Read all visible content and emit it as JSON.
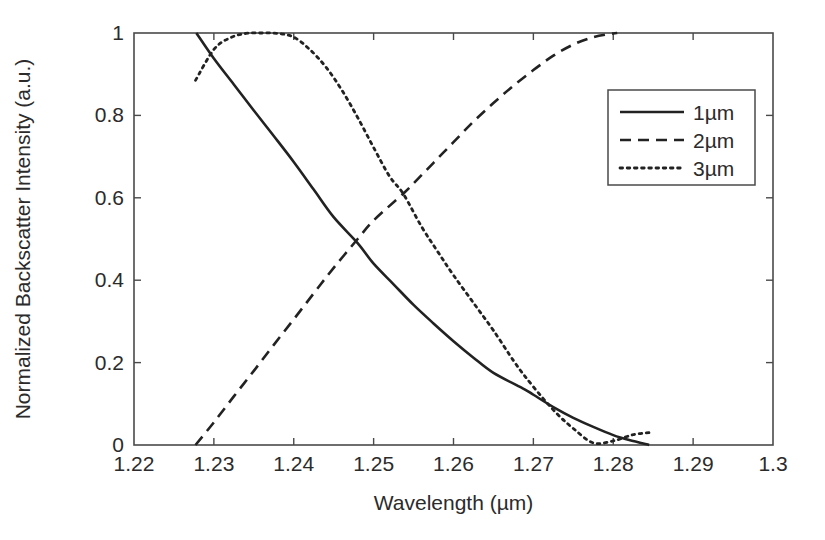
{
  "chart_data": {
    "type": "line",
    "title": "",
    "xlabel": "Wavelength (µm)",
    "ylabel": "Normalized Backscatter Intensity (a.u.)",
    "xlim": [
      1.22,
      1.3
    ],
    "ylim": [
      0,
      1
    ],
    "xticks": [
      1.22,
      1.23,
      1.24,
      1.25,
      1.26,
      1.27,
      1.28,
      1.29,
      1.3
    ],
    "xtick_labels": [
      "1.22",
      "1.23",
      "1.24",
      "1.25",
      "1.26",
      "1.27",
      "1.28",
      "1.29",
      "1.3"
    ],
    "yticks": [
      0,
      0.2,
      0.4,
      0.6,
      0.8,
      1
    ],
    "ytick_labels": [
      "0",
      "0.2",
      "0.4",
      "0.6",
      "0.8",
      "1"
    ],
    "grid": false,
    "legend_position": "upper right",
    "legend_entries": [
      "1µm",
      "2µm",
      "3µm"
    ],
    "series": [
      {
        "name": "1µm",
        "style": "solid",
        "color": "#222222",
        "x": [
          1.2278,
          1.23,
          1.2325,
          1.235,
          1.2375,
          1.24,
          1.2425,
          1.245,
          1.248,
          1.25,
          1.2525,
          1.255,
          1.2575,
          1.26,
          1.2625,
          1.265,
          1.2689,
          1.27,
          1.2725,
          1.275,
          1.2775,
          1.28,
          1.282,
          1.2845
        ],
        "y": [
          1.0,
          0.938,
          0.875,
          0.812,
          0.75,
          0.687,
          0.62,
          0.553,
          0.49,
          0.44,
          0.39,
          0.34,
          0.295,
          0.252,
          0.212,
          0.175,
          0.135,
          0.122,
          0.092,
          0.066,
          0.044,
          0.024,
          0.012,
          0.0
        ]
      },
      {
        "name": "2µm",
        "style": "dashed",
        "color": "#222222",
        "x": [
          1.2277,
          1.23,
          1.2325,
          1.235,
          1.2375,
          1.24,
          1.2425,
          1.245,
          1.248,
          1.25,
          1.2537,
          1.255,
          1.2575,
          1.26,
          1.2625,
          1.265,
          1.2675,
          1.27,
          1.2725,
          1.275,
          1.2775,
          1.28,
          1.2805
        ],
        "y": [
          0.0,
          0.055,
          0.118,
          0.18,
          0.243,
          0.305,
          0.368,
          0.43,
          0.5,
          0.545,
          0.61,
          0.635,
          0.685,
          0.735,
          0.785,
          0.83,
          0.872,
          0.91,
          0.945,
          0.972,
          0.99,
          0.999,
          1.0
        ]
      },
      {
        "name": "3µm",
        "style": "dotted",
        "color": "#222222",
        "x": [
          1.2277,
          1.23,
          1.232,
          1.234,
          1.236,
          1.238,
          1.24,
          1.242,
          1.244,
          1.246,
          1.248,
          1.25,
          1.252,
          1.2537,
          1.256,
          1.258,
          1.26,
          1.2625,
          1.265,
          1.2675,
          1.2689,
          1.271,
          1.273,
          1.275,
          1.2775,
          1.28,
          1.2825,
          1.2845
        ],
        "y": [
          0.885,
          0.96,
          0.988,
          0.999,
          1.0,
          0.999,
          0.99,
          0.96,
          0.918,
          0.862,
          0.795,
          0.722,
          0.652,
          0.61,
          0.53,
          0.47,
          0.412,
          0.345,
          0.278,
          0.205,
          0.168,
          0.118,
          0.075,
          0.04,
          0.005,
          0.01,
          0.025,
          0.03
        ]
      }
    ]
  },
  "plot_geometry": {
    "left": 134,
    "top": 33,
    "right": 773,
    "bottom": 445
  },
  "legend": {
    "box": {
      "x": 608,
      "y": 90,
      "width": 147,
      "height": 95
    }
  }
}
